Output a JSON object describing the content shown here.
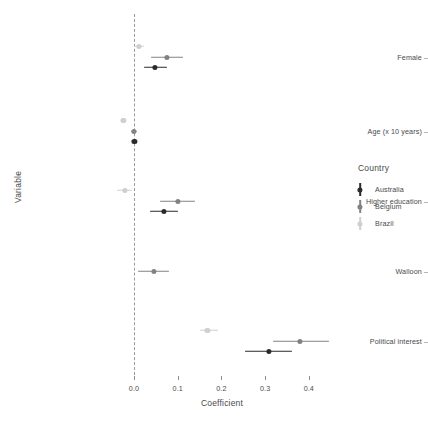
{
  "chart_data": {
    "type": "scatter",
    "title": "",
    "xlabel": "Coefficient",
    "ylabel": "Variable",
    "xlim": [
      -0.06,
      0.47
    ],
    "xticks": [
      0.0,
      0.1,
      0.2,
      0.3,
      0.4
    ],
    "xticklabels": [
      "0.0",
      "0.1",
      "0.2",
      "0.3",
      "0.4"
    ],
    "categories": [
      "Female",
      "Age (x 10 years)",
      "Higher education",
      "Walloon",
      "Political interest"
    ],
    "grid": false,
    "reference_line": 0.0,
    "legend_title": "Country",
    "legend_position": "right",
    "series": [
      {
        "name": "Australia",
        "color": "#2b2b2b",
        "points": [
          {
            "category": "Female",
            "estimate": 0.047,
            "low": 0.023,
            "high": 0.075
          },
          {
            "category": "Age (x 10 years)",
            "estimate": 0.001,
            "low": -0.003,
            "high": 0.005
          },
          {
            "category": "Higher education",
            "estimate": 0.068,
            "low": 0.037,
            "high": 0.1
          },
          {
            "category": "Walloon",
            "estimate": null,
            "low": null,
            "high": null
          },
          {
            "category": "Political interest",
            "estimate": 0.308,
            "low": 0.254,
            "high": 0.362
          }
        ]
      },
      {
        "name": "Belgium",
        "color": "#828282",
        "points": [
          {
            "category": "Female",
            "estimate": 0.076,
            "low": 0.04,
            "high": 0.112
          },
          {
            "category": "Age (x 10 years)",
            "estimate": -0.001,
            "low": -0.008,
            "high": 0.006
          },
          {
            "category": "Higher education",
            "estimate": 0.1,
            "low": 0.06,
            "high": 0.14
          },
          {
            "category": "Walloon",
            "estimate": 0.045,
            "low": 0.01,
            "high": 0.08
          },
          {
            "category": "Political interest",
            "estimate": 0.38,
            "low": 0.318,
            "high": 0.446
          }
        ]
      },
      {
        "name": "Brazil",
        "color": "#cfcfcf",
        "points": [
          {
            "category": "Female",
            "estimate": 0.011,
            "low": 0.0,
            "high": 0.022
          },
          {
            "category": "Age (x 10 years)",
            "estimate": -0.024,
            "low": -0.026,
            "high": -0.022
          },
          {
            "category": "Higher education",
            "estimate": -0.021,
            "low": -0.038,
            "high": -0.004
          },
          {
            "category": "Walloon",
            "estimate": null,
            "low": null,
            "high": null
          },
          {
            "category": "Political interest",
            "estimate": 0.168,
            "low": 0.152,
            "high": 0.193
          }
        ]
      }
    ]
  },
  "legend": {
    "title": "Country",
    "items": [
      {
        "label": "Australia",
        "color": "#2b2b2b"
      },
      {
        "label": "Belgium",
        "color": "#828282"
      },
      {
        "label": "Brazil",
        "color": "#cfcfcf"
      }
    ]
  },
  "axes": {
    "x_title": "Coefficient",
    "y_title": "Variable",
    "x_tick_labels": [
      "0.0",
      "0.1",
      "0.2",
      "0.3",
      "0.4"
    ],
    "y_tick_labels": [
      "Female",
      "Age (x 10 years)",
      "Higher education",
      "Walloon",
      "Political interest"
    ]
  }
}
